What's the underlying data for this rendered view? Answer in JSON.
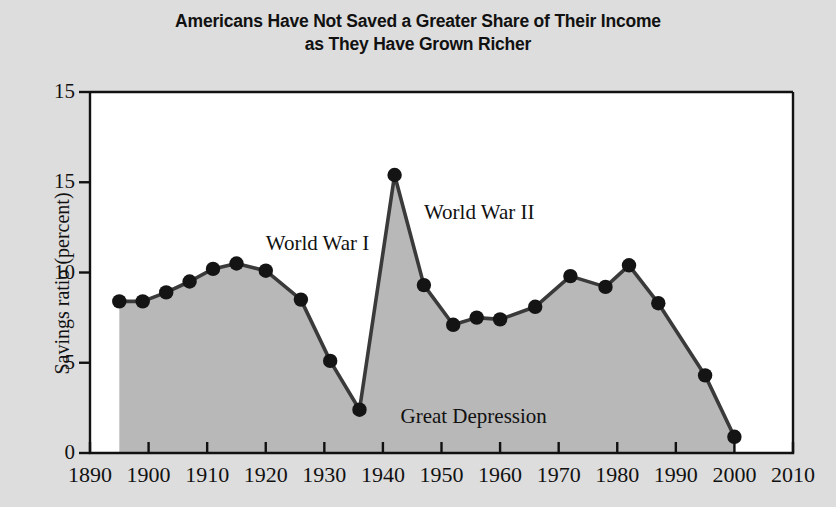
{
  "title": {
    "line1": "Americans Have Not Saved a Greater Share of Their Income",
    "line2": "as They Have Grown Richer"
  },
  "chart_data": {
    "type": "area",
    "title": "Americans Have Not Saved a Greater Share of Their Income as They Have Grown Richer",
    "xlabel": "",
    "ylabel": "Savings ratio (percent)",
    "xlim": [
      1890,
      2010
    ],
    "ylim": [
      0,
      20
    ],
    "grid": false,
    "legend": null,
    "xticks": [
      "1890",
      "1900",
      "1910",
      "1920",
      "1930",
      "1940",
      "1950",
      "1960",
      "1970",
      "1980",
      "1990",
      "2000",
      "2010"
    ],
    "xtick_values": [
      1890,
      1900,
      1910,
      1920,
      1930,
      1940,
      1950,
      1960,
      1970,
      1980,
      1990,
      2000,
      2010
    ],
    "yticks": [
      "15",
      "15",
      "10",
      "5",
      "0"
    ],
    "ytick_values": [
      20,
      15,
      10,
      5,
      0
    ],
    "series": [
      {
        "name": "Savings ratio (percent)",
        "x": [
          1895,
          1899,
          1903,
          1907,
          1911,
          1915,
          1920,
          1926,
          1931,
          1936,
          1942,
          1947,
          1952,
          1956,
          1960,
          1966,
          1972,
          1978,
          1982,
          1987,
          1995,
          2000
        ],
        "values": [
          8.4,
          8.4,
          8.9,
          9.5,
          10.2,
          10.5,
          10.1,
          8.5,
          5.1,
          2.4,
          15.4,
          9.3,
          7.1,
          7.5,
          7.4,
          8.1,
          9.8,
          9.2,
          10.4,
          8.3,
          4.3,
          0.9
        ]
      }
    ],
    "annotations": [
      {
        "text": "World War I",
        "x": 1920,
        "y": 11.6
      },
      {
        "text": "World War II",
        "x": 1947,
        "y": 13.3
      },
      {
        "text": "Great Depression",
        "x": 1943,
        "y": 2.0
      }
    ],
    "colors": {
      "area_fill": "#b8b8b8",
      "line": "#3a3a3a",
      "marker": "#141414",
      "plot_background": "#ffffff",
      "figure_background": "#dddddd",
      "axis": "#111111",
      "text": "#111111"
    }
  }
}
